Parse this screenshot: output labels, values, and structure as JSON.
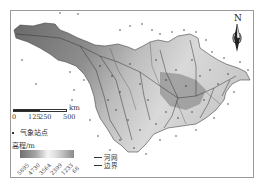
{
  "map": {
    "title": "",
    "north_label": "N",
    "scale": {
      "unit": "km",
      "ticks": [
        "0",
        "125",
        "250",
        "500"
      ]
    },
    "legend": {
      "station_label": "气象站点",
      "elevation_title": "高程/m",
      "elevation_ticks": [
        "5895",
        "4730",
        "3564",
        "2399",
        "1233",
        "68"
      ],
      "lines": [
        {
          "label": "河网",
          "icon": "river-line-icon"
        },
        {
          "label": "边界",
          "icon": "boundary-line-icon"
        }
      ]
    },
    "colors": {
      "high_elevation": "#6f6f6f",
      "low_elevation": "#e8e8e8",
      "frame": "#9a9a9a",
      "lines": "#333333"
    }
  }
}
